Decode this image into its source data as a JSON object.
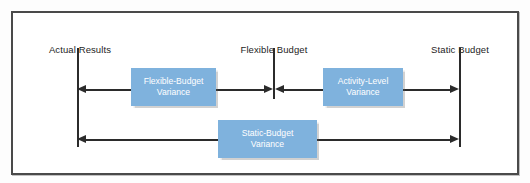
{
  "diagram": {
    "frame": {
      "border_color": "#4a4a4a",
      "background": "#ffffff"
    },
    "accent_color": "#7fb2dd",
    "line_color": "#2b2b2b",
    "columns": [
      {
        "id": "actual-results",
        "label": "Actual Results"
      },
      {
        "id": "flexible-budget",
        "label": "Flexible Budget"
      },
      {
        "id": "static-budget",
        "label": "Static Budget"
      }
    ],
    "variances": [
      {
        "id": "flexible-budget-variance",
        "line1": "Flexible-Budget",
        "line2": "Variance",
        "from": "Flexible Budget",
        "to": "Actual Results",
        "row": "top"
      },
      {
        "id": "activity-level-variance",
        "line1": "Activity-Level",
        "line2": "Variance",
        "from": "Flexible Budget",
        "to": "Static Budget",
        "row": "top"
      },
      {
        "id": "static-budget-variance",
        "line1": "Static-Budget",
        "line2": "Variance",
        "from": "Actual Results",
        "to": "Static Budget",
        "row": "bottom"
      }
    ]
  }
}
